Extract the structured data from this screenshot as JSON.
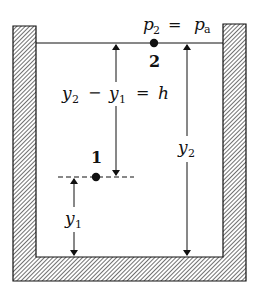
{
  "figure": {
    "type": "hydrostatic-tank",
    "colors": {
      "ink": "#111111",
      "wall_hatch": "#333333",
      "background": "#ffffff"
    },
    "point_2": {
      "label": "2",
      "pressure_lhs": "p",
      "pressure_lhs_sub": "2",
      "equals": "=",
      "pressure_rhs": "p",
      "pressure_rhs_sub": "a"
    },
    "point_1": {
      "label": "1"
    },
    "height_difference": {
      "y2": "y",
      "y2_sub": "2",
      "minus": "−",
      "y1": "y",
      "y1_sub": "1",
      "equals": "=",
      "h": "h"
    },
    "dimension_y2": {
      "var": "y",
      "sub": "2"
    },
    "dimension_y1": {
      "var": "y",
      "sub": "1"
    }
  }
}
